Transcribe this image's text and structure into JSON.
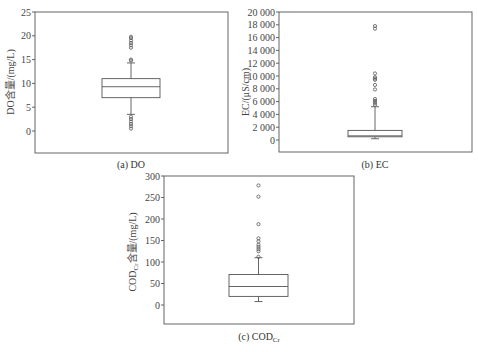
{
  "chart_data": [
    {
      "type": "box",
      "id": "do",
      "caption": "(a) DO",
      "ylabel": "DO含量/(mg/L)",
      "ylim": [
        -5,
        25
      ],
      "yticks": [
        0,
        5,
        10,
        15,
        20,
        25
      ],
      "ytick_labels": [
        "0",
        "5",
        "10",
        "15",
        "20",
        "25"
      ],
      "box": {
        "q1": 7.0,
        "median": 9.3,
        "q3": 11.0,
        "whisker_low": 3.5,
        "whisker_high": 14.3
      },
      "outliers": [
        0.5,
        1.0,
        1.5,
        2.0,
        2.5,
        3.0,
        14.8,
        15.0,
        17.5,
        18.0,
        18.5,
        19.0,
        19.5,
        19.8
      ]
    },
    {
      "type": "box",
      "id": "ec",
      "caption": "(b) EC",
      "ylabel": "EC/(μS/cm)",
      "ylim": [
        -2000,
        20000
      ],
      "yticks": [
        0,
        2000,
        4000,
        6000,
        8000,
        10000,
        12000,
        14000,
        16000,
        18000,
        20000
      ],
      "ytick_labels": [
        "0",
        "2 000",
        "4 000",
        "6 000",
        "8 000",
        "10 000",
        "12 000",
        "14 000",
        "16 000",
        "18 000",
        "20 000"
      ],
      "box": {
        "q1": 500,
        "median": 650,
        "q3": 1500,
        "whisker_low": 200,
        "whisker_high": 5200
      },
      "outliers": [
        5500,
        5800,
        6100,
        6400,
        7900,
        8600,
        9400,
        9600,
        9800,
        10400,
        17400,
        17800
      ]
    },
    {
      "type": "box",
      "id": "cod",
      "caption": "(c) COD",
      "caption_sub": "Cr",
      "ylabel": "COD",
      "ylabel_sub": "Cr",
      "ylabel_rest": "含量/(mg/L)",
      "ylim": [
        -45,
        300
      ],
      "yticks": [
        0,
        50,
        100,
        150,
        200,
        250,
        300
      ],
      "ytick_labels": [
        "0",
        "50",
        "100",
        "150",
        "200",
        "250",
        "300"
      ],
      "box": {
        "q1": 20,
        "median": 43,
        "q3": 71,
        "whisker_low": 8,
        "whisker_high": 110
      },
      "outliers": [
        112,
        125,
        130,
        135,
        140,
        148,
        155,
        188,
        252,
        278
      ]
    }
  ]
}
